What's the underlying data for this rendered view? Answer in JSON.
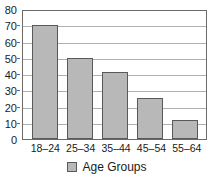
{
  "chart_data": {
    "type": "bar",
    "title": "",
    "title_clipped": true,
    "categories": [
      "18–24",
      "25–34",
      "35–44",
      "45–54",
      "55–64"
    ],
    "values": [
      70,
      50,
      41,
      25,
      12
    ],
    "series": [
      {
        "name": "Age Groups",
        "values": [
          70,
          50,
          41,
          25,
          12
        ]
      }
    ],
    "xlabel": "",
    "ylabel": "",
    "ylim": [
      0,
      80
    ],
    "ytick_step": 10,
    "yticks": [
      0,
      10,
      20,
      30,
      40,
      50,
      60,
      70,
      80
    ],
    "ytick_labels": [
      "0",
      "10",
      "20",
      "30",
      "40",
      "50",
      "60",
      "70",
      "80"
    ],
    "grid": true,
    "grid_axis": "y",
    "legend": [
      "Age Groups"
    ],
    "legend_position": "bottom-center",
    "bar_color": "#b8b8b8",
    "bar_border_color": "#595959",
    "grid_color": "#b0b0b0",
    "axis_color": "#6b6b6b",
    "text_color": "#1a1a1a",
    "background": "#ffffff"
  },
  "legend": {
    "swatch_name": "legend-swatch-age-groups",
    "label": "Age Groups"
  }
}
